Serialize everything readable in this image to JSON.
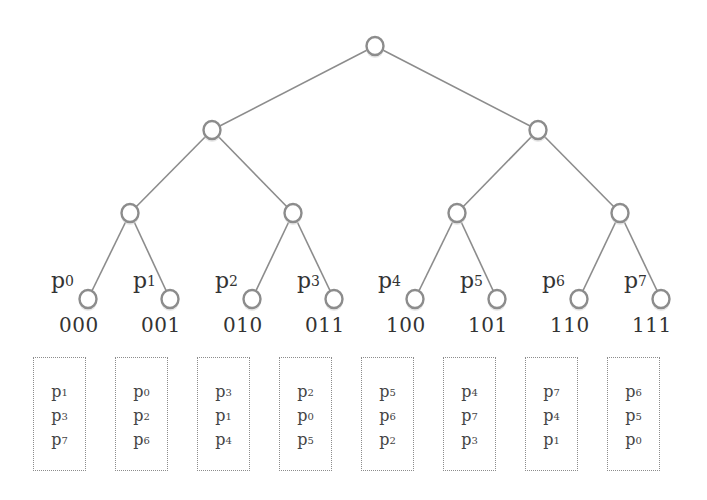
{
  "tree": {
    "root": {
      "x": 375,
      "y": 46
    },
    "level1": [
      {
        "x": 212,
        "y": 130
      },
      {
        "x": 538,
        "y": 130
      }
    ],
    "level2": [
      {
        "x": 130,
        "y": 213
      },
      {
        "x": 293,
        "y": 213
      },
      {
        "x": 457,
        "y": 213
      },
      {
        "x": 620,
        "y": 213
      }
    ],
    "leaves": [
      {
        "name": "p",
        "sub": "0",
        "code": "000",
        "x": 88,
        "y": 299
      },
      {
        "name": "p",
        "sub": "1",
        "code": "001",
        "x": 170,
        "y": 299
      },
      {
        "name": "p",
        "sub": "2",
        "code": "010",
        "x": 252,
        "y": 299
      },
      {
        "name": "p",
        "sub": "3",
        "code": "011",
        "x": 334,
        "y": 299
      },
      {
        "name": "p",
        "sub": "4",
        "code": "100",
        "x": 415,
        "y": 299
      },
      {
        "name": "p",
        "sub": "5",
        "code": "101",
        "x": 497,
        "y": 299
      },
      {
        "name": "p",
        "sub": "6",
        "code": "110",
        "x": 579,
        "y": 299
      },
      {
        "name": "p",
        "sub": "7",
        "code": "111",
        "x": 661,
        "y": 299
      }
    ]
  },
  "buckets": [
    {
      "x": 33,
      "items": [
        {
          "name": "p",
          "sub": "1"
        },
        {
          "name": "p",
          "sub": "3"
        },
        {
          "name": "p",
          "sub": "7"
        }
      ]
    },
    {
      "x": 115,
      "items": [
        {
          "name": "p",
          "sub": "0"
        },
        {
          "name": "p",
          "sub": "2"
        },
        {
          "name": "p",
          "sub": "6"
        }
      ]
    },
    {
      "x": 197,
      "items": [
        {
          "name": "p",
          "sub": "3"
        },
        {
          "name": "p",
          "sub": "1"
        },
        {
          "name": "p",
          "sub": "4"
        }
      ]
    },
    {
      "x": 279,
      "items": [
        {
          "name": "p",
          "sub": "2"
        },
        {
          "name": "p",
          "sub": "0"
        },
        {
          "name": "p",
          "sub": "5"
        }
      ]
    },
    {
      "x": 361,
      "items": [
        {
          "name": "p",
          "sub": "5"
        },
        {
          "name": "p",
          "sub": "6"
        },
        {
          "name": "p",
          "sub": "2"
        }
      ]
    },
    {
      "x": 443,
      "items": [
        {
          "name": "p",
          "sub": "4"
        },
        {
          "name": "p",
          "sub": "7"
        },
        {
          "name": "p",
          "sub": "3"
        }
      ]
    },
    {
      "x": 525,
      "items": [
        {
          "name": "p",
          "sub": "7"
        },
        {
          "name": "p",
          "sub": "4"
        },
        {
          "name": "p",
          "sub": "1"
        }
      ]
    },
    {
      "x": 607,
      "items": [
        {
          "name": "p",
          "sub": "6"
        },
        {
          "name": "p",
          "sub": "5"
        },
        {
          "name": "p",
          "sub": "0"
        }
      ]
    }
  ],
  "colors": {
    "line": "#8c8c8c",
    "text": "#333333"
  }
}
